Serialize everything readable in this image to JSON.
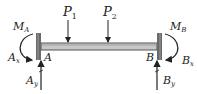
{
  "diagram": {
    "type": "fixed-fixed beam free body diagram",
    "loads": [
      {
        "label": "P",
        "sub": "1"
      },
      {
        "label": "P",
        "sub": "2"
      }
    ],
    "support_a": {
      "point": "A",
      "moment": {
        "label": "M",
        "sub": "A"
      },
      "horizontal": {
        "label": "A",
        "sub": "x"
      },
      "vertical": {
        "label": "A",
        "sub": "y"
      }
    },
    "support_b": {
      "point": "B",
      "moment": {
        "label": "M",
        "sub": "B"
      },
      "horizontal": {
        "label": "B",
        "sub": "x"
      },
      "vertical": {
        "label": "B",
        "sub": "y"
      }
    },
    "colors": {
      "beam_fill": "#c8c8c8",
      "beam_edge": "#555555",
      "wall": "#6a6a6a",
      "arrow": "#222222"
    }
  }
}
